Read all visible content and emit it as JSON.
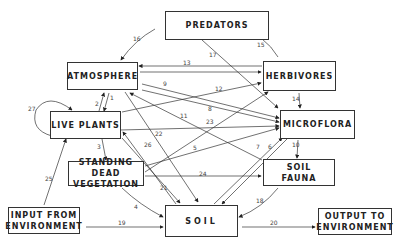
{
  "boxes": {
    "predators": "PREDATORS",
    "atmosphere": "ATMOSPHERE",
    "herbivores": "HERBIVORES",
    "live_plants": "LIVE PLANTS",
    "microflora": "MICROFLORA",
    "standing_dead_1": "STANDING DEAD",
    "standing_dead_2": "VEGETATION",
    "soil_fauna_1": "SOIL",
    "soil_fauna_2": "FAUNA",
    "input_1": "INPUT FROM",
    "input_2": "ENVIRONMENT",
    "soil": "SOIL",
    "output_1": "OUTPUT TO",
    "output_2": "ENVIRONMENT"
  },
  "flows": {
    "f1": "1",
    "f2": "2",
    "f3": "3",
    "f4": "4",
    "f5": "5",
    "f6": "6",
    "f7": "7",
    "f8": "8",
    "f9": "9",
    "f10": "10",
    "f11": "11",
    "f12": "12",
    "f13": "13",
    "f14": "14",
    "f15": "15",
    "f16": "16",
    "f17": "17",
    "f18": "18",
    "f19": "19",
    "f20": "20",
    "f21": "21",
    "f22": "22",
    "f23": "23",
    "f24": "24",
    "f25": "25",
    "f26": "26",
    "f27": "27"
  }
}
